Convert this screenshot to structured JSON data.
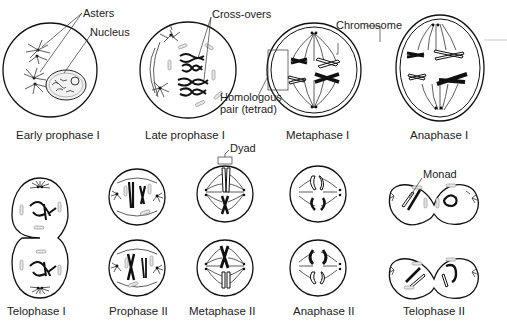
{
  "diagram": {
    "top_row": [
      {
        "id": "early-prophase-1",
        "caption": "Early prophase I"
      },
      {
        "id": "late-prophase-1",
        "caption": "Late prophase I"
      },
      {
        "id": "metaphase-1",
        "caption": "Metaphase I"
      },
      {
        "id": "anaphase-1",
        "caption": "Anaphase I"
      }
    ],
    "bottom_row": [
      {
        "id": "telophase-1",
        "caption": "Telophase I"
      },
      {
        "id": "prophase-2",
        "caption": "Prophase II"
      },
      {
        "id": "metaphase-2",
        "caption": "Metaphase II"
      },
      {
        "id": "anaphase-2",
        "caption": "Anaphase II"
      },
      {
        "id": "telophase-2",
        "caption": "Telophase II"
      }
    ],
    "annotations": {
      "asters": "Asters",
      "nucleus": "Nucleus",
      "cross_overs": "Cross-overs",
      "chromosome": "Chromosome",
      "homologous_line1": "Homologous",
      "homologous_line2": "pair (tetrad)",
      "dyad": "Dyad",
      "monad": "Monad"
    }
  }
}
